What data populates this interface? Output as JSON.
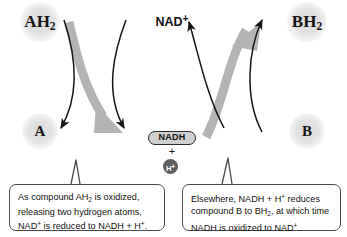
{
  "figure": {
    "colors": {
      "halo_circle": "#e2e2e2",
      "thick_arrow_gray": "#b4b4b4",
      "thin_arrow_black": "#141414",
      "hplus_circle": "#5f5f5f",
      "nadh_pill_fill": "#cfcfcf",
      "callout_border": "#4a4a4a",
      "background": "#ffffff"
    }
  },
  "nodes": {
    "ah2": {
      "label": "AH",
      "subscript": "2",
      "full": "AH2"
    },
    "a": {
      "label": "A"
    },
    "bh2": {
      "label": "BH",
      "subscript": "2",
      "full": "BH2"
    },
    "b": {
      "label": "B"
    },
    "nad_plus": {
      "label": "NAD",
      "superscript": "+",
      "full": "NAD+"
    },
    "nadh": {
      "label": "NADH"
    },
    "plus": {
      "label": "+"
    },
    "h_plus": {
      "label": "H",
      "superscript": "+",
      "full": "H+"
    }
  },
  "callouts": {
    "left": {
      "name": "oxidation-callout",
      "line1_pre": "As compound AH",
      "line1_sub": "2",
      "line1_post": " is oxidized,",
      "line2": "releasing two hydrogen atoms,",
      "line3_pre": "NAD",
      "line3_sup": "+",
      "line3_mid": " is reduced to NADH + H",
      "line3_sup2": "+",
      "line3_end": ".",
      "plain": "As compound AH2 is oxidized, releasing two hydrogen atoms, NAD+ is reduced to NADH + H+."
    },
    "right": {
      "name": "reduction-callout",
      "line1_pre": "Elsewhere, NADH + H",
      "line1_sup": "+",
      "line1_post": " reduces",
      "line2_pre": "compound B to BH",
      "line2_sub": "2",
      "line2_post": ", at which time",
      "line3_pre": "NADH is oxidized to NAD",
      "line3_sup": "+",
      "line3_end": ".",
      "plain": "Elsewhere, NADH + H+ reduces compound B to BH2, at which time NADH is oxidized to NAD+."
    }
  },
  "arrows": {
    "left_gray": "AH2 to NADH (hydrogen transfer, curving down-right)",
    "left_thin_down": "AH2 down to A",
    "left_thin_up": "NAD+ pathway crossing up-right",
    "right_gray": "NADH to BH2 (hydrogen transfer, curving up-right)",
    "right_thin_up": "B up to BH2",
    "right_thin_left": "arrow toward NAD+"
  }
}
